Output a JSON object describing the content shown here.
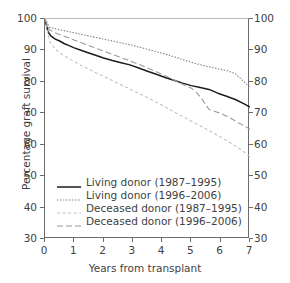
{
  "chart_data": {
    "type": "line",
    "title": "",
    "xlabel": "Years from transplant",
    "ylabel": "Percentage graft survival",
    "xlim": [
      0,
      7
    ],
    "ylim": [
      30,
      100
    ],
    "xticks": [
      0,
      1,
      2,
      3,
      4,
      5,
      6,
      7
    ],
    "yticks": [
      30,
      40,
      50,
      60,
      70,
      80,
      90,
      100
    ],
    "right_axis_ticks": [
      30,
      40,
      50,
      60,
      70,
      80,
      90,
      100
    ],
    "grid": false,
    "legend_position": "lower-left-inside",
    "series": [
      {
        "name": "Living donor (1987–1995)",
        "style": "solid",
        "color": "#1c1c1c",
        "x": [
          0,
          0.1,
          0.2,
          0.35,
          0.5,
          0.65,
          0.8,
          1.0,
          1.25,
          1.5,
          1.75,
          2.0,
          2.3,
          2.6,
          2.9,
          3.2,
          3.5,
          3.8,
          4.1,
          4.4,
          4.7,
          5.0,
          5.3,
          5.6,
          5.9,
          6.2,
          6.5,
          6.8,
          7.0
        ],
        "y": [
          100,
          96.0,
          94.6,
          93.6,
          93.0,
          92.2,
          91.6,
          90.8,
          90.0,
          89.2,
          88.4,
          87.6,
          86.8,
          86.1,
          85.4,
          84.4,
          83.4,
          82.4,
          81.4,
          80.5,
          79.6,
          78.8,
          78.2,
          77.6,
          76.4,
          75.4,
          74.4,
          73.0,
          72.0
        ]
      },
      {
        "name": "Living donor (1996–2006)",
        "style": "dotted",
        "color": "#7d7d7d",
        "x": [
          0,
          0.15,
          0.4,
          0.7,
          1.0,
          1.4,
          1.8,
          2.2,
          2.6,
          3.0,
          3.4,
          3.8,
          4.2,
          4.6,
          5.0,
          5.4,
          5.8,
          6.2,
          6.5,
          6.8,
          7.0
        ],
        "y": [
          100,
          97.4,
          96.8,
          96.2,
          95.6,
          94.8,
          94.0,
          93.2,
          92.4,
          91.6,
          90.6,
          89.6,
          88.6,
          87.4,
          86.2,
          85.2,
          84.4,
          83.6,
          82.6,
          80.0,
          78.2
        ]
      },
      {
        "name": "Deceased donor (1987–1995)",
        "style": "short-dash",
        "color": "#c0c0c0",
        "x": [
          0,
          0.15,
          0.35,
          0.6,
          0.9,
          1.2,
          1.5,
          1.9,
          2.3,
          2.7,
          3.1,
          3.5,
          3.9,
          4.3,
          4.7,
          5.1,
          5.5,
          5.9,
          6.3,
          6.7,
          7.0
        ],
        "y": [
          100,
          93.0,
          90.4,
          88.6,
          87.0,
          85.4,
          84.0,
          82.2,
          80.4,
          78.6,
          76.8,
          75.0,
          73.0,
          71.0,
          69.0,
          67.0,
          65.0,
          63.0,
          60.8,
          58.4,
          56.2
        ]
      },
      {
        "name": "Deceased donor (1996–2006)",
        "style": "long-dash",
        "color": "#9a9a9a",
        "x": [
          0,
          0.15,
          0.4,
          0.8,
          1.2,
          1.6,
          2.0,
          2.4,
          2.8,
          3.2,
          3.6,
          4.0,
          4.4,
          4.8,
          5.0,
          5.2,
          5.4,
          5.6,
          5.8,
          6.0,
          6.3,
          6.6,
          7.0
        ],
        "y": [
          100,
          96.6,
          95.4,
          94.0,
          92.6,
          91.2,
          89.8,
          88.4,
          87.0,
          85.6,
          84.0,
          82.4,
          80.6,
          78.8,
          78.0,
          76.4,
          74.0,
          71.2,
          70.6,
          70.0,
          68.6,
          67.0,
          65.0
        ]
      }
    ]
  },
  "axes": {
    "y_title": "Percentage graft survival",
    "x_title": "Years from transplant",
    "y_tick_labels": [
      "100",
      "90",
      "80",
      "70",
      "60",
      "50",
      "40",
      "30"
    ],
    "y_right_tick_labels": [
      "100",
      "90",
      "80",
      "70",
      "60",
      "50",
      "40",
      "30"
    ],
    "x_tick_labels": [
      "0",
      "1",
      "2",
      "3",
      "4",
      "5",
      "6",
      "7"
    ]
  },
  "legend": {
    "items": [
      {
        "label": "Living donor (1987–1995)",
        "style": "solid",
        "color": "#1c1c1c"
      },
      {
        "label": "Living donor (1996–2006)",
        "style": "dotted",
        "color": "#7d7d7d"
      },
      {
        "label": "Deceased donor (1987–1995)",
        "style": "short-dash",
        "color": "#c0c0c0"
      },
      {
        "label": "Deceased donor (1996–2006)",
        "style": "long-dash",
        "color": "#9a9a9a"
      }
    ]
  },
  "caption": {
    "text": ""
  }
}
